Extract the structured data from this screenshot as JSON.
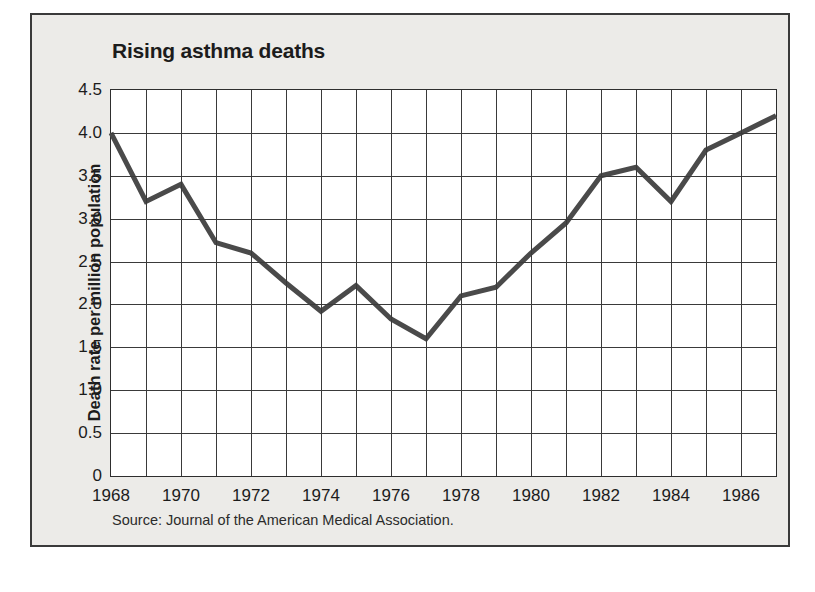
{
  "figure": {
    "title": "Rising asthma deaths",
    "source_note": "Source: Journal of the American Medical Association.",
    "background_color": "#ecebe8",
    "plot_background_color": "#ffffff",
    "border_color": "#3a3a3a",
    "grid_color": "#3a3a3a",
    "line_color": "#4a4a4a"
  },
  "chart_data": {
    "type": "line",
    "title": "Rising asthma deaths",
    "xlabel": "",
    "ylabel": "Death rate per million population",
    "xlim": [
      1968,
      1987
    ],
    "ylim": [
      0,
      4.5
    ],
    "grid": true,
    "legend": "none",
    "annotation": "Source: Journal of the American Medical Association.",
    "y_ticks": [
      "0",
      "0.5",
      "1.0",
      "1.5",
      "2.0",
      "2.5",
      "3.0",
      "3.5",
      "4.0",
      "4.5"
    ],
    "y_tick_values": [
      0,
      0.5,
      1.0,
      1.5,
      2.0,
      2.5,
      3.0,
      3.5,
      4.0,
      4.5
    ],
    "x_ticks": [
      "1968",
      "1970",
      "1972",
      "1974",
      "1976",
      "1978",
      "1980",
      "1982",
      "1984",
      "1986"
    ],
    "x_tick_values": [
      1968,
      1970,
      1972,
      1974,
      1976,
      1978,
      1980,
      1982,
      1984,
      1986
    ],
    "x": [
      1968,
      1969,
      1970,
      1971,
      1972,
      1973,
      1974,
      1975,
      1976,
      1977,
      1978,
      1979,
      1980,
      1981,
      1982,
      1983,
      1984,
      1985,
      1986,
      1987
    ],
    "values": [
      4.0,
      3.2,
      3.4,
      2.72,
      2.6,
      2.25,
      1.92,
      2.22,
      1.83,
      1.6,
      2.1,
      2.2,
      2.6,
      2.95,
      3.5,
      3.6,
      3.2,
      3.8,
      4.0,
      4.2
    ],
    "series": [
      {
        "name": "Death rate per million population",
        "values": [
          4.0,
          3.2,
          3.4,
          2.72,
          2.6,
          2.25,
          1.92,
          2.22,
          1.83,
          1.6,
          2.1,
          2.2,
          2.6,
          2.95,
          3.5,
          3.6,
          3.2,
          3.8,
          4.0,
          4.2
        ]
      }
    ]
  }
}
